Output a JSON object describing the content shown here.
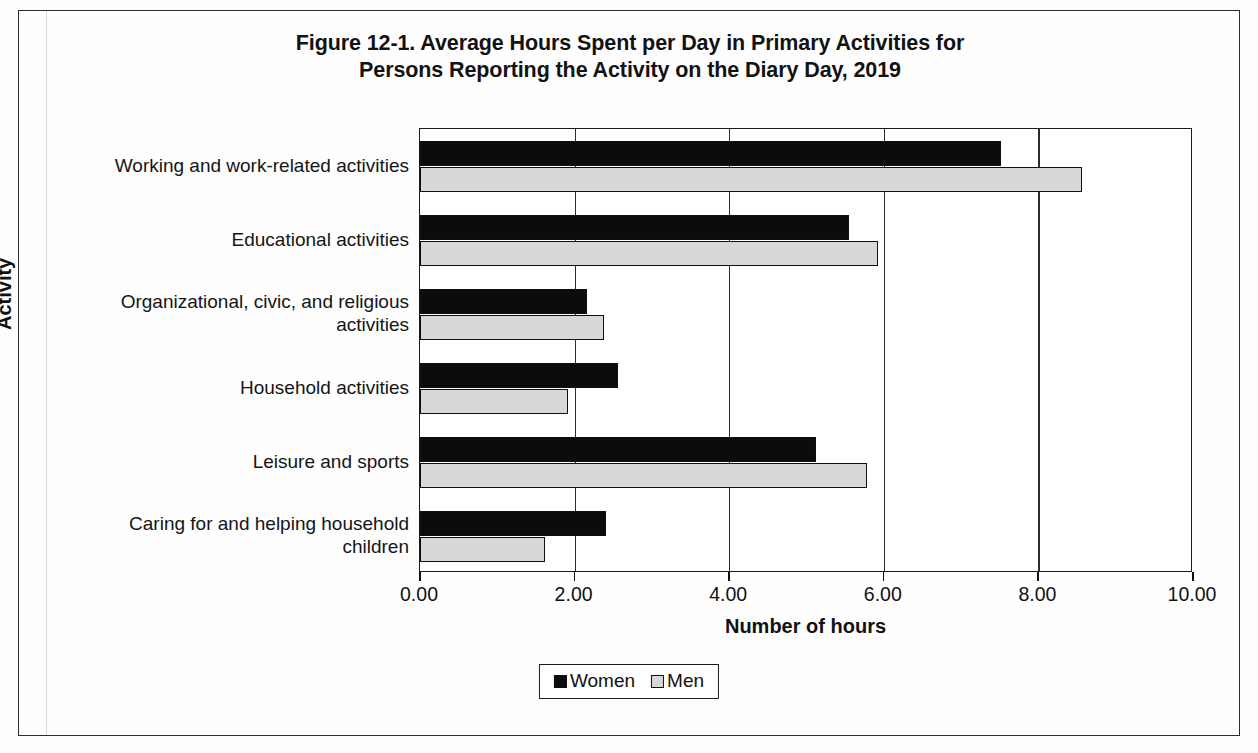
{
  "figure": {
    "title_line1": "Figure 12-1. Average Hours Spent per Day in Primary Activities for",
    "title_line2": "Persons Reporting the Activity on the Diary Day, 2019"
  },
  "axes": {
    "y_title": "Activity",
    "x_title": "Number of hours",
    "x_ticks": [
      "0.00",
      "2.00",
      "4.00",
      "6.00",
      "8.00",
      "10.00"
    ]
  },
  "legend": {
    "items": [
      {
        "label": "Women",
        "color": "#0c0c0c",
        "swatch_name": "legend-swatch-women"
      },
      {
        "label": "Men",
        "color": "#d8d8d8",
        "swatch_name": "legend-swatch-men"
      }
    ]
  },
  "chart_data": {
    "type": "bar",
    "orientation": "horizontal",
    "title": "Figure 12-1. Average Hours Spent per Day in Primary Activities for Persons Reporting the Activity on the Diary Day, 2019",
    "xlabel": "Number of hours",
    "ylabel": "Activity",
    "xlim": [
      0,
      10
    ],
    "xticks": [
      0,
      2,
      4,
      6,
      8,
      10
    ],
    "grid": true,
    "legend_position": "bottom",
    "categories": [
      "Working and work-related activities",
      "Educational activities",
      "Organizational, civic, and religious activities",
      "Household activities",
      "Leisure and sports",
      "Caring for and helping household children"
    ],
    "category_label_lines": [
      [
        "Working and work-related activities"
      ],
      [
        "Educational activities"
      ],
      [
        "Organizational, civic, and religious",
        "activities"
      ],
      [
        "Household activities"
      ],
      [
        "Leisure and sports"
      ],
      [
        "Caring for and helping household",
        "children"
      ]
    ],
    "series": [
      {
        "name": "Women",
        "color": "#0c0c0c",
        "values": [
          7.52,
          5.55,
          2.16,
          2.56,
          5.12,
          2.4
        ]
      },
      {
        "name": "Men",
        "color": "#d8d8d8",
        "values": [
          8.56,
          5.92,
          2.38,
          1.92,
          5.78,
          1.62
        ]
      }
    ]
  }
}
